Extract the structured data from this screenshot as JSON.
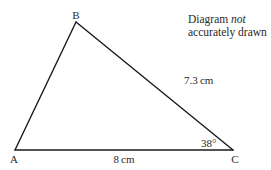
{
  "diagram": {
    "type": "triangle",
    "vertices": {
      "A": {
        "label": "A",
        "x": 15,
        "y": 150
      },
      "B": {
        "label": "B",
        "x": 76,
        "y": 22
      },
      "C": {
        "label": "C",
        "x": 233,
        "y": 150
      }
    },
    "sides": {
      "BC": {
        "label": "7.3 cm"
      },
      "AC": {
        "label": "8 cm"
      }
    },
    "angles": {
      "C": {
        "label": "38°"
      }
    },
    "note": {
      "line1_prefix": "Diagram ",
      "line1_emphasis": "not",
      "line2": "accurately drawn"
    },
    "colors": {
      "stroke": "#1a1a1a",
      "text": "#2a2a2a",
      "background": "#ffffff"
    }
  }
}
